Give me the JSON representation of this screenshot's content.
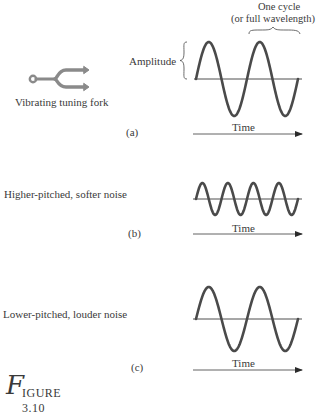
{
  "figure": {
    "caption_initial": "F",
    "caption_rest": "IGURE 3.10"
  },
  "panel_a": {
    "tag": "(a)",
    "source_label": "Vibrating tuning fork",
    "amplitude_label": "Amplitude",
    "cycle_label_line1": "One cycle",
    "cycle_label_line2": "(or full wavelength)",
    "time_label": "Time",
    "wave": {
      "cycles": 2,
      "amplitude_px": 37,
      "x_start": 196,
      "x_end": 298,
      "axis_y": 79
    }
  },
  "panel_b": {
    "tag": "(b)",
    "description": "Higher-pitched, softer noise",
    "time_label": "Time",
    "wave": {
      "cycles": 4,
      "amplitude_px": 16,
      "x_start": 196,
      "x_end": 298,
      "axis_y": 199
    }
  },
  "panel_c": {
    "tag": "(c)",
    "description": "Lower-pitched, louder noise",
    "time_label": "Time",
    "wave": {
      "cycles": 2,
      "amplitude_px": 32,
      "x_start": 196,
      "x_end": 298,
      "axis_y": 319
    }
  },
  "colors": {
    "wave": "#4a4a4a",
    "axis": "#3a3a3a",
    "fork": "#8a8a8a",
    "text": "#3a3a3a"
  }
}
